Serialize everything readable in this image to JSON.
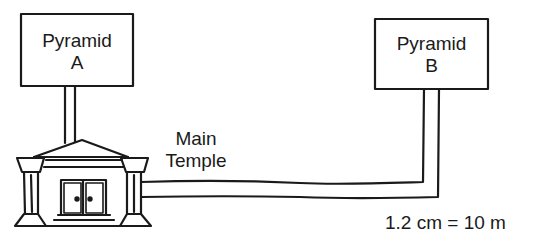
{
  "diagram": {
    "pyramid_a": {
      "line1": "Pyramid",
      "line2": "A"
    },
    "pyramid_b": {
      "line1": "Pyramid",
      "line2": "B"
    },
    "temple": {
      "line1": "Main",
      "line2": "Temple"
    },
    "scale": "1.2 cm = 10 m",
    "colors": {
      "ink": "#1a1a1a",
      "background": "#ffffff"
    }
  }
}
